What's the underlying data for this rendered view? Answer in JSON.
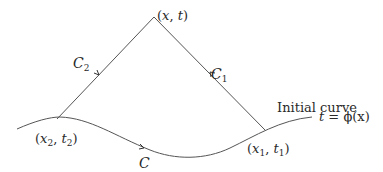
{
  "diagram": {
    "labels": {
      "apex": "(x, t)",
      "apex_x": "x",
      "apex_t": "t",
      "left_char": "C",
      "left_char_sub": "2",
      "right_char": "C",
      "right_char_sub": "1",
      "left_point_x": "x",
      "left_point_x_sub": "2",
      "left_point_t": "t",
      "left_point_t_sub": "2",
      "right_point_x": "x",
      "right_point_x_sub": "1",
      "right_point_t": "t",
      "right_point_t_sub": "1",
      "curve_name": "C",
      "initial_curve": "Initial curve",
      "initial_curve_eq_lhs": "t",
      "initial_curve_eq_rhs": " = ϕ(x)"
    },
    "colors": {
      "line": "#555555",
      "text": "#2a2a2a"
    }
  }
}
